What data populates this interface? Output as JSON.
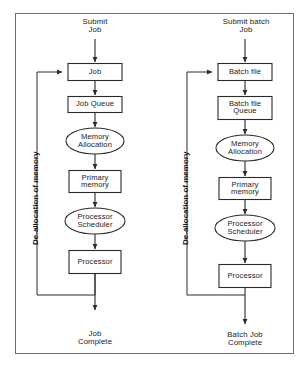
{
  "figure": {
    "border_color": "#6f6f6f",
    "shape_stroke_color": "#2a2a2a",
    "shape_fill_color": "#ffffff",
    "text_color": "#1b1b1b",
    "background_color": "#ffffff"
  },
  "columns": [
    {
      "id": "single-job",
      "entry_label": "Submit\nJob",
      "exit_label": "Job\nComplete",
      "feedback_label": "De-allocation of memory",
      "nodes": [
        {
          "id": "job",
          "label": "Job",
          "shape": "rect"
        },
        {
          "id": "job-queue",
          "label": "Job Queue",
          "shape": "rect"
        },
        {
          "id": "mem-alloc",
          "label": "Memory\nAllocation",
          "shape": "ellipse"
        },
        {
          "id": "prim-mem",
          "label": "Primary\nmemory",
          "shape": "rect"
        },
        {
          "id": "proc-sched",
          "label": "Processor\nScheduler",
          "shape": "ellipse"
        },
        {
          "id": "processor",
          "label": "Processor",
          "shape": "rect"
        }
      ]
    },
    {
      "id": "batch-job",
      "entry_label": "Submit batch\nJob",
      "exit_label": "Batch Job\nComplete",
      "feedback_label": "De-allocation of memory",
      "nodes": [
        {
          "id": "batch-file",
          "label": "Batch file",
          "shape": "rect"
        },
        {
          "id": "batch-file-queue",
          "label": "Batch file\nQueue",
          "shape": "rect"
        },
        {
          "id": "mem-alloc",
          "label": "Memory\nAllocation",
          "shape": "ellipse"
        },
        {
          "id": "prim-mem",
          "label": "Primary\nmemory",
          "shape": "rect"
        },
        {
          "id": "proc-sched",
          "label": "Processor\nScheduler",
          "shape": "ellipse"
        },
        {
          "id": "processor",
          "label": "Processor",
          "shape": "rect"
        }
      ]
    }
  ]
}
